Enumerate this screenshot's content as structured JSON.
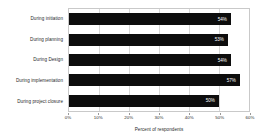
{
  "chart_data": {
    "type": "bar",
    "orientation": "horizontal",
    "title": "",
    "xlabel": "Percent of respondents",
    "ylabel": "",
    "categories": [
      "During initiation",
      "During planning",
      "During Design",
      "During implementation",
      "During project closure"
    ],
    "values": [
      54,
      53,
      54,
      57,
      50
    ],
    "value_labels": [
      "54%",
      "53%",
      "54%",
      "57%",
      "50%"
    ],
    "xlim": [
      0,
      60
    ],
    "xticks": [
      0,
      10,
      20,
      30,
      40,
      50,
      60
    ],
    "xtick_labels": [
      "0%",
      "10%",
      "20%",
      "30%",
      "40%",
      "50%",
      "60%"
    ],
    "grid": "vertical",
    "legend": "none",
    "bar_color": "#0d0d0d",
    "value_label_color": "#ffffff",
    "gridline_color": "#d8d8d8",
    "plot_border_color": "#c9c9c9",
    "background_color": "#ffffff"
  }
}
